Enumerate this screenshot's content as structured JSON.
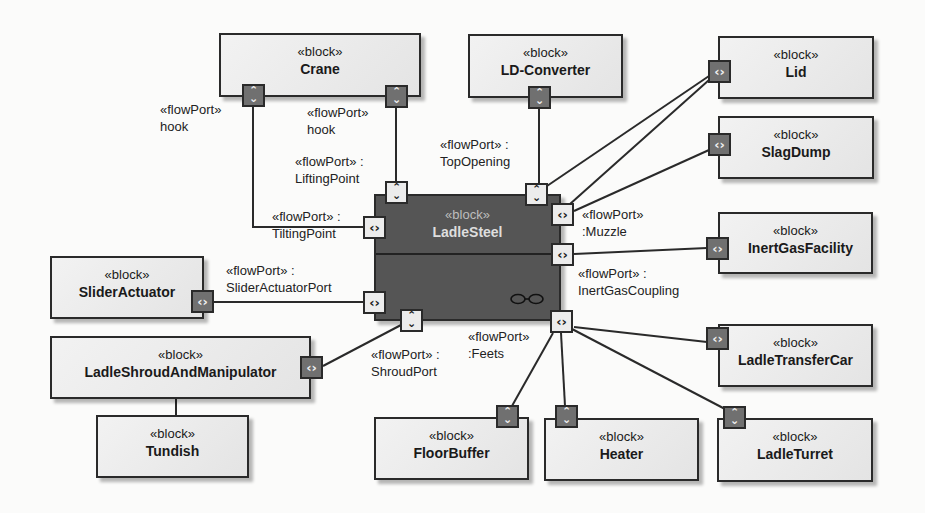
{
  "diagram": {
    "type": "SysML internal block diagram",
    "stereotype_block": "«block»",
    "central_block": {
      "name": "LadleSteel",
      "stereotype": "«block»"
    },
    "blocks": [
      {
        "id": "crane",
        "name": "Crane",
        "stereotype": "«block»"
      },
      {
        "id": "ld_converter",
        "name": "LD-Converter",
        "stereotype": "«block»"
      },
      {
        "id": "lid",
        "name": "Lid",
        "stereotype": "«block»"
      },
      {
        "id": "slag_dump",
        "name": "SlagDump",
        "stereotype": "«block»"
      },
      {
        "id": "inert_gas_facility",
        "name": "InertGasFacility",
        "stereotype": "«block»"
      },
      {
        "id": "slider_actuator",
        "name": "SliderActuator",
        "stereotype": "«block»"
      },
      {
        "id": "ladle_shroud",
        "name": "LadleShroudAndManipulator",
        "stereotype": "«block»"
      },
      {
        "id": "tundish",
        "name": "Tundish",
        "stereotype": "«block»"
      },
      {
        "id": "ladle_transfer_car",
        "name": "LadleTransferCar",
        "stereotype": "«block»"
      },
      {
        "id": "floor_buffer",
        "name": "FloorBuffer",
        "stereotype": "«block»"
      },
      {
        "id": "heater",
        "name": "Heater",
        "stereotype": "«block»"
      },
      {
        "id": "ladle_turret",
        "name": "LadleTurret",
        "stereotype": "«block»"
      }
    ],
    "port_labels": {
      "crane_hook_left": {
        "line1": "«flowPort»",
        "line2": "hook"
      },
      "crane_hook_right": {
        "line1": "«flowPort»",
        "line2": "hook"
      },
      "lifting_point": {
        "line1": "«flowPort» :",
        "line2": "LiftingPoint"
      },
      "tilting_point": {
        "line1": "«flowPort» :",
        "line2": "TiltingPoint"
      },
      "top_opening": {
        "line1": "«flowPort» :",
        "line2": "TopOpening"
      },
      "muzzle": {
        "line1": "«flowPort»",
        "line2": ":Muzzle"
      },
      "inert_gas_coupling": {
        "line1": "«flowPort» :",
        "line2": "InertGasCoupling"
      },
      "slider_actuator_port": {
        "line1": "«flowPort» :",
        "line2": "SliderActuatorPort"
      },
      "shroud_port": {
        "line1": "«flowPort» :",
        "line2": "ShroudPort"
      },
      "feets": {
        "line1": "«flowPort»",
        "line2": ":Feets"
      }
    },
    "port_glyphs": {
      "horizontal": "‹›",
      "vertical": "⌃⌄"
    },
    "colors": {
      "background": "#fbfbfa",
      "block_fill": "#e8e8e8",
      "central_block_fill": "#555555",
      "external_port_fill": "#707070",
      "internal_port_fill": "#ececec",
      "line": "#2a2a2a"
    }
  }
}
